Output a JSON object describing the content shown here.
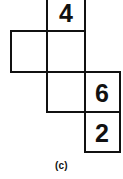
{
  "figure": {
    "caption": "(c)",
    "type": "cube-net",
    "stroke_color": "#111111",
    "fill_color": "#ffffff",
    "background_color": "#ffffff",
    "cells": [
      {
        "id": "cell-top",
        "label": "4",
        "row": 1,
        "col": 2,
        "x": 47,
        "y": -9,
        "width": 38,
        "height": 40,
        "has_label": true
      },
      {
        "id": "cell-left",
        "label": "",
        "row": 2,
        "col": 1,
        "x": 11,
        "y": 31,
        "width": 36,
        "height": 41,
        "has_label": false
      },
      {
        "id": "cell-middle-upper",
        "label": "",
        "row": 2,
        "col": 2,
        "x": 47,
        "y": 31,
        "width": 38,
        "height": 41,
        "has_label": false
      },
      {
        "id": "cell-middle-lower",
        "label": "",
        "row": 3,
        "col": 2,
        "x": 47,
        "y": 72,
        "width": 38,
        "height": 40,
        "has_label": false
      },
      {
        "id": "cell-right-upper",
        "label": "6",
        "row": 3,
        "col": 3,
        "x": 85,
        "y": 72,
        "width": 35,
        "height": 40,
        "has_label": true
      },
      {
        "id": "cell-right-lower",
        "label": "2",
        "row": 4,
        "col": 3,
        "x": 85,
        "y": 112,
        "width": 35,
        "height": 40,
        "has_label": true
      }
    ]
  }
}
